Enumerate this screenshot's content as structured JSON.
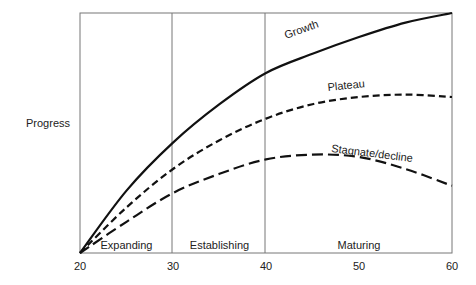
{
  "chart_data": {
    "type": "line",
    "title": "",
    "xlabel": "",
    "ylabel": "Progress",
    "xlim": [
      20,
      60
    ],
    "ylim": [
      0,
      100
    ],
    "x_ticks": [
      "20",
      "30",
      "40",
      "50",
      "60"
    ],
    "grid": false,
    "legend_position": "inline labels",
    "x": [
      20,
      25,
      30,
      35,
      40,
      45,
      50,
      55,
      60
    ],
    "series": [
      {
        "name": "Growth",
        "style": "solid",
        "values": [
          0,
          26,
          46,
          62,
          75,
          83,
          90,
          96,
          100
        ]
      },
      {
        "name": "Plateau",
        "style": "short-dash",
        "values": [
          0,
          19,
          35,
          47,
          56,
          62,
          65,
          66,
          65
        ]
      },
      {
        "name": "Stagnate/decline",
        "style": "long-dash",
        "values": [
          0,
          13,
          25,
          33,
          39,
          41,
          40,
          35,
          28
        ]
      }
    ],
    "regions": [
      {
        "label": "Expanding",
        "from": 20,
        "to": 30
      },
      {
        "label": "Establishing",
        "from": 30,
        "to": 40
      },
      {
        "label": "Maturing",
        "from": 40,
        "to": 60
      }
    ]
  }
}
